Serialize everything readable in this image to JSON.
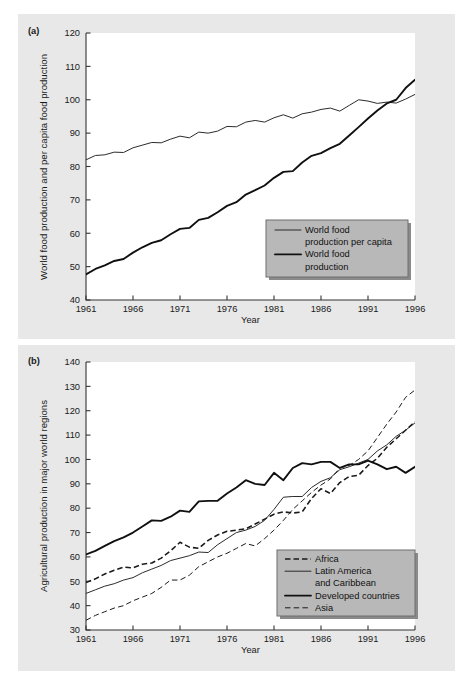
{
  "figure": {
    "background_color": "#ffffff",
    "panel_color": "#e8e8e8",
    "plot_color": "#ffffff"
  },
  "panel_a": {
    "tag": "(a)",
    "legend_bg": "#b8b8b8"
  },
  "panel_b": {
    "tag": "(b)",
    "legend_bg": "#b8b8b8"
  },
  "chart_data": [
    {
      "id": "chart-a",
      "type": "line",
      "title": "",
      "panel_label": "(a)",
      "xlabel": "Year",
      "ylabel": "World food production and per capita food production",
      "xlim": [
        1961,
        1996
      ],
      "ylim": [
        40,
        120
      ],
      "xticks": [
        1961,
        1966,
        1971,
        1976,
        1981,
        1986,
        1991,
        1996
      ],
      "yticks": [
        40,
        50,
        60,
        70,
        80,
        90,
        100,
        110,
        120
      ],
      "grid": false,
      "legend_position": "bottom-right",
      "x": [
        1961,
        1962,
        1963,
        1964,
        1965,
        1966,
        1967,
        1968,
        1969,
        1970,
        1971,
        1972,
        1973,
        1974,
        1975,
        1976,
        1977,
        1978,
        1979,
        1980,
        1981,
        1982,
        1983,
        1984,
        1985,
        1986,
        1987,
        1988,
        1989,
        1990,
        1991,
        1992,
        1993,
        1994,
        1995,
        1996
      ],
      "series": [
        {
          "name": "World food production per capita",
          "style": "solid-thin",
          "values": [
            82.0,
            83.3,
            83.5,
            84.3,
            84.2,
            85.6,
            86.4,
            87.2,
            87.1,
            88.2,
            89.1,
            88.6,
            90.3,
            90.0,
            90.6,
            92.0,
            91.9,
            93.3,
            93.8,
            93.3,
            94.6,
            95.5,
            94.5,
            95.8,
            96.3,
            97.1,
            97.5,
            96.6,
            98.3,
            100.0,
            99.6,
            98.9,
            99.3,
            99.0,
            100.2,
            101.6
          ]
        },
        {
          "name": "World food production",
          "style": "solid-thick",
          "values": [
            47.7,
            49.3,
            50.4,
            51.7,
            52.3,
            54.2,
            55.8,
            57.1,
            57.9,
            59.7,
            61.3,
            61.6,
            64.0,
            64.6,
            66.3,
            68.2,
            69.3,
            71.6,
            72.9,
            74.3,
            76.6,
            78.4,
            78.6,
            81.2,
            83.2,
            84.0,
            85.5,
            86.8,
            89.3,
            91.8,
            94.4,
            96.8,
            98.9,
            100.0,
            103.5,
            106.0,
            111.8
          ]
        }
      ]
    },
    {
      "id": "chart-b",
      "type": "line",
      "title": "",
      "panel_label": "(b)",
      "xlabel": "Year",
      "ylabel": "Agricultural production in major world regions",
      "xlim": [
        1961,
        1996
      ],
      "ylim": [
        30,
        140
      ],
      "xticks": [
        1961,
        1966,
        1971,
        1976,
        1981,
        1986,
        1991,
        1996
      ],
      "yticks": [
        30,
        40,
        50,
        60,
        70,
        80,
        90,
        100,
        110,
        120,
        130,
        140
      ],
      "grid": false,
      "legend_position": "bottom-right",
      "x": [
        1961,
        1962,
        1963,
        1964,
        1965,
        1966,
        1967,
        1968,
        1969,
        1970,
        1971,
        1972,
        1973,
        1974,
        1975,
        1976,
        1977,
        1978,
        1979,
        1980,
        1981,
        1982,
        1983,
        1984,
        1985,
        1986,
        1987,
        1988,
        1989,
        1990,
        1991,
        1992,
        1993,
        1994,
        1995,
        1996
      ],
      "series": [
        {
          "name": "Africa",
          "style": "dashed-thick",
          "values": [
            49.5,
            51.0,
            53.0,
            54.5,
            55.8,
            55.5,
            57.0,
            57.5,
            59.5,
            62.5,
            66.0,
            64.0,
            63.5,
            66.8,
            69.0,
            70.5,
            71.0,
            71.5,
            73.5,
            75.5,
            77.5,
            78.5,
            78.0,
            78.5,
            84.0,
            88.0,
            86.0,
            90.5,
            93.0,
            93.5,
            97.5,
            100.5,
            105.0,
            108.5,
            112.0,
            115.5
          ]
        },
        {
          "name": "Latin America and Caribbean",
          "style": "solid-thin",
          "values": [
            45.0,
            46.5,
            48.0,
            49.0,
            50.5,
            51.5,
            53.5,
            55.0,
            56.5,
            58.5,
            59.5,
            60.5,
            62.0,
            61.8,
            65.0,
            67.5,
            70.0,
            71.0,
            72.5,
            75.0,
            79.5,
            84.5,
            84.8,
            84.8,
            88.5,
            91.0,
            92.5,
            95.8,
            97.0,
            98.5,
            100.0,
            103.5,
            106.0,
            109.5,
            112.0,
            115.0
          ]
        },
        {
          "name": "Developed countries",
          "style": "solid-thick",
          "values": [
            61.0,
            62.5,
            64.5,
            66.5,
            68.0,
            70.0,
            72.5,
            75.0,
            74.8,
            76.5,
            79.0,
            78.5,
            82.8,
            83.0,
            83.0,
            86.0,
            88.5,
            91.5,
            90.0,
            89.5,
            94.5,
            91.5,
            96.5,
            98.5,
            98.0,
            99.0,
            99.0,
            96.5,
            98.0,
            98.0,
            99.5,
            98.0,
            96.0,
            97.0,
            94.5,
            97.0
          ]
        },
        {
          "name": "Asia",
          "style": "dashed-thin",
          "values": [
            34.0,
            36.0,
            37.5,
            39.0,
            40.0,
            42.0,
            43.5,
            45.0,
            47.5,
            50.5,
            50.5,
            52.5,
            56.0,
            58.0,
            60.0,
            61.5,
            63.5,
            65.5,
            64.5,
            67.5,
            71.0,
            75.0,
            79.5,
            83.0,
            86.5,
            89.5,
            92.0,
            96.5,
            97.5,
            100.0,
            103.5,
            109.0,
            114.5,
            119.5,
            125.5,
            128.5
          ]
        }
      ]
    }
  ],
  "chart_a_legend": {
    "items": [
      {
        "label_line1": "World food",
        "label_line2": "production per capita",
        "style": "solid-thin"
      },
      {
        "label_line1": "World food",
        "label_line2": "production",
        "style": "solid-thick"
      }
    ]
  },
  "chart_b_legend": {
    "items": [
      {
        "label_line1": "Africa",
        "label_line2": "",
        "style": "dashed-thick"
      },
      {
        "label_line1": "Latin America",
        "label_line2": "and Caribbean",
        "style": "solid-thin"
      },
      {
        "label_line1": "Developed countries",
        "label_line2": "",
        "style": "solid-thick"
      },
      {
        "label_line1": "Asia",
        "label_line2": "",
        "style": "dashed-thin"
      }
    ]
  }
}
